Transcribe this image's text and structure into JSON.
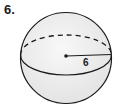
{
  "problem": {
    "number": "6."
  },
  "figure": {
    "shape": "sphere",
    "radius_label": "6",
    "colors": {
      "outline": "#1a1a1a",
      "fill": "#efefef",
      "background": "#ffffff"
    }
  }
}
